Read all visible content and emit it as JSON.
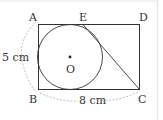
{
  "diagram": {
    "type": "geometry",
    "points": {
      "A": "A",
      "E": "E",
      "D": "D",
      "B": "B",
      "C": "C",
      "O": "O"
    },
    "dimensions": {
      "height": "5 cm",
      "width": "8 cm"
    },
    "colors": {
      "stroke": "#333333",
      "dashed": "#aaaaaa",
      "border": "#dddddd"
    }
  }
}
